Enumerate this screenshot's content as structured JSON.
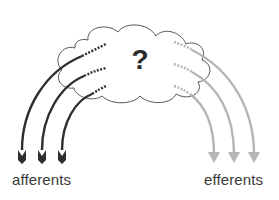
{
  "diagram": {
    "center_symbol": "?",
    "labels": {
      "left": "afferents",
      "right": "efferents"
    },
    "colors": {
      "afferent": "#2e2e2e",
      "efferent": "#b5b5b5",
      "cloud_outline": "#555555",
      "text": "#3a3a3a"
    },
    "afferent_count": 3,
    "efferent_count": 3
  }
}
